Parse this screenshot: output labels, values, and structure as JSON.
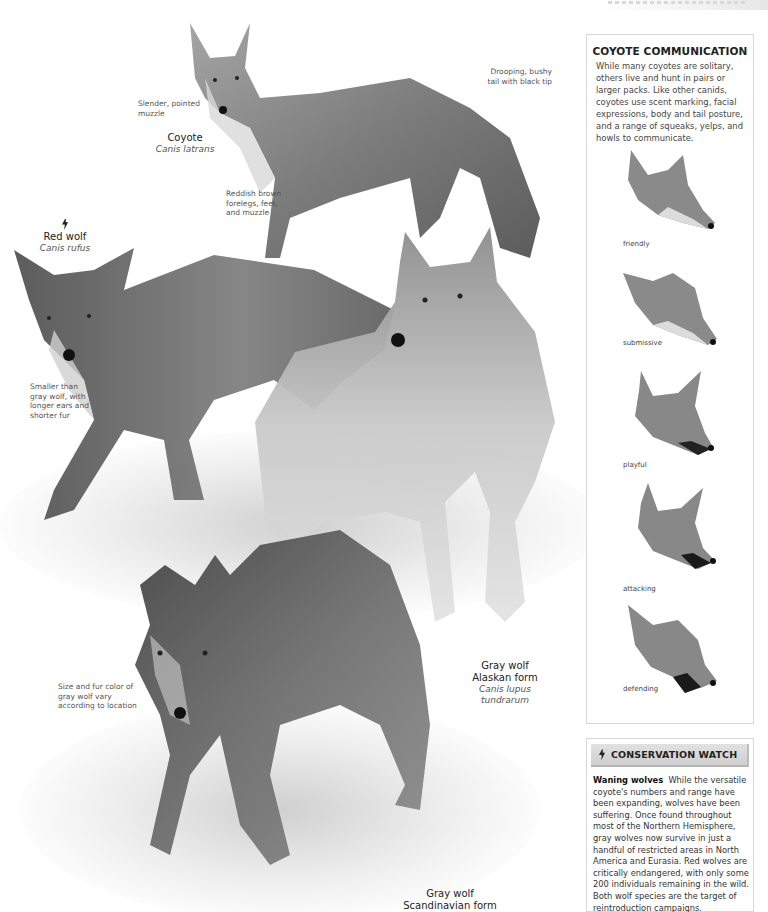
{
  "page": {
    "running_head": ""
  },
  "illustration": {
    "coyote": {
      "common_name": "Coyote",
      "latin_name": "Canis latrans",
      "annotations": {
        "muzzle": "Slender, pointed muzzle",
        "tail": "Drooping, bushy tail with black tip",
        "forelegs": "Reddish brown forelegs, feet, and muzzle"
      }
    },
    "red_wolf": {
      "common_name": "Red wolf",
      "latin_name": "Canis rufus",
      "status_icon": "endangered-icon",
      "annotations": {
        "size": "Smaller than gray wolf, with longer ears and shorter fur"
      }
    },
    "gray_wolf_alaskan": {
      "common_name": "Gray wolf",
      "form": "Alaskan form",
      "latin_name": "Canis lupus tundrarum"
    },
    "gray_wolf_scandinavian": {
      "common_name": "Gray wolf",
      "form": "Scandinavian form",
      "annotations": {
        "variation": "Size and fur color of gray wolf vary according to location"
      }
    }
  },
  "communication_box": {
    "title": "COYOTE COMMUNICATION",
    "body": "While many coyotes are solitary, others live and hunt in pairs or larger packs. Like other canids, coyotes use scent marking, facial expressions, body and tail posture, and a range of squeaks, yelps, and howls to communicate.",
    "expressions": [
      {
        "label": "friendly"
      },
      {
        "label": "submissive"
      },
      {
        "label": "playful"
      },
      {
        "label": "attacking"
      },
      {
        "label": "defending"
      }
    ]
  },
  "conservation_box": {
    "icon": "endangered-icon",
    "title": "CONSERVATION WATCH",
    "lead": "Waning wolves",
    "body": "While the versatile coyote's numbers and range have been expanding, wolves have been suffering. Once found throughout most of the Northern Hemisphere, gray wolves now survive in just a handful of restricted areas in North America and Eurasia. Red wolves are critically endangered, with only some 200 individuals remaining in the wild. Both wolf species are the target of reintroduction campaigns."
  },
  "colors": {
    "box_border": "#d8d8d8",
    "header_bar": "#d6d6d6",
    "text_dark": "#222222",
    "text_body": "#444444"
  }
}
